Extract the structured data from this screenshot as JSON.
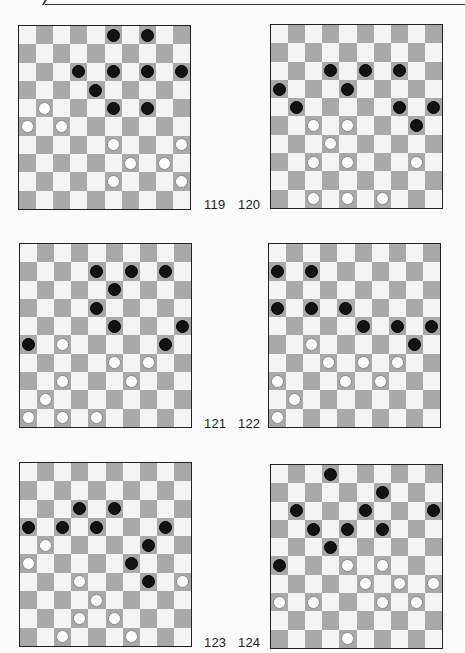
{
  "page": {
    "boards": [
      {
        "number": "119",
        "black": [
          [
            0,
            5
          ],
          [
            0,
            7
          ],
          [
            2,
            3
          ],
          [
            2,
            5
          ],
          [
            2,
            7
          ],
          [
            2,
            9
          ],
          [
            3,
            4
          ],
          [
            4,
            5
          ],
          [
            4,
            7
          ]
        ],
        "white": [
          [
            4,
            1
          ],
          [
            5,
            0
          ],
          [
            5,
            2
          ],
          [
            6,
            5
          ],
          [
            6,
            9
          ],
          [
            7,
            6
          ],
          [
            7,
            8
          ],
          [
            8,
            5
          ],
          [
            8,
            9
          ]
        ]
      },
      {
        "number": "120",
        "black": [
          [
            2,
            3
          ],
          [
            2,
            5
          ],
          [
            2,
            7
          ],
          [
            3,
            0
          ],
          [
            3,
            4
          ],
          [
            4,
            1
          ],
          [
            4,
            7
          ],
          [
            4,
            9
          ],
          [
            5,
            8
          ]
        ],
        "white": [
          [
            5,
            2
          ],
          [
            5,
            4
          ],
          [
            6,
            3
          ],
          [
            7,
            2
          ],
          [
            7,
            4
          ],
          [
            7,
            8
          ],
          [
            9,
            2
          ],
          [
            9,
            4
          ],
          [
            9,
            6
          ]
        ]
      },
      {
        "number": "121",
        "black": [
          [
            1,
            4
          ],
          [
            1,
            6
          ],
          [
            1,
            8
          ],
          [
            2,
            5
          ],
          [
            3,
            4
          ],
          [
            4,
            5
          ],
          [
            4,
            9
          ],
          [
            5,
            0
          ],
          [
            5,
            8
          ]
        ],
        "white": [
          [
            5,
            2
          ],
          [
            6,
            5
          ],
          [
            6,
            7
          ],
          [
            7,
            2
          ],
          [
            7,
            6
          ],
          [
            8,
            1
          ],
          [
            9,
            0
          ],
          [
            9,
            2
          ],
          [
            9,
            4
          ]
        ]
      },
      {
        "number": "122",
        "black": [
          [
            1,
            0
          ],
          [
            1,
            2
          ],
          [
            3,
            0
          ],
          [
            3,
            2
          ],
          [
            3,
            4
          ],
          [
            4,
            5
          ],
          [
            4,
            7
          ],
          [
            4,
            9
          ],
          [
            5,
            8
          ]
        ],
        "white": [
          [
            5,
            2
          ],
          [
            6,
            3
          ],
          [
            6,
            5
          ],
          [
            6,
            7
          ],
          [
            7,
            0
          ],
          [
            7,
            4
          ],
          [
            7,
            6
          ],
          [
            8,
            1
          ],
          [
            9,
            0
          ]
        ]
      },
      {
        "number": "123",
        "black": [
          [
            2,
            3
          ],
          [
            2,
            5
          ],
          [
            3,
            0
          ],
          [
            3,
            2
          ],
          [
            3,
            4
          ],
          [
            3,
            8
          ],
          [
            4,
            7
          ],
          [
            5,
            6
          ],
          [
            6,
            7
          ]
        ],
        "white": [
          [
            4,
            1
          ],
          [
            5,
            0
          ],
          [
            6,
            3
          ],
          [
            6,
            9
          ],
          [
            7,
            4
          ],
          [
            8,
            3
          ],
          [
            8,
            5
          ],
          [
            9,
            2
          ],
          [
            9,
            6
          ]
        ]
      },
      {
        "number": "124",
        "black": [
          [
            0,
            3
          ],
          [
            1,
            6
          ],
          [
            2,
            1
          ],
          [
            2,
            5
          ],
          [
            2,
            9
          ],
          [
            3,
            2
          ],
          [
            3,
            4
          ],
          [
            3,
            6
          ],
          [
            4,
            3
          ],
          [
            5,
            0
          ]
        ],
        "white": [
          [
            5,
            4
          ],
          [
            5,
            6
          ],
          [
            6,
            5
          ],
          [
            6,
            7
          ],
          [
            6,
            9
          ],
          [
            7,
            0
          ],
          [
            7,
            2
          ],
          [
            7,
            6
          ],
          [
            7,
            8
          ],
          [
            9,
            4
          ]
        ]
      }
    ],
    "colors": {
      "dark_square": "#a9a9a9",
      "light_square": "#f4f4f4",
      "black_piece": "#121212",
      "white_piece": "#ffffff"
    }
  }
}
